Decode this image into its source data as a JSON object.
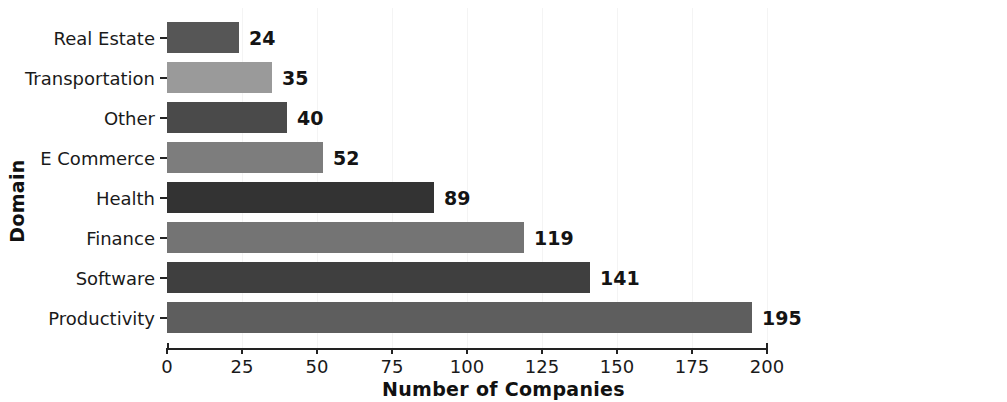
{
  "chart_data": {
    "type": "bar",
    "orientation": "horizontal",
    "title": "",
    "xlabel": "Number of Companies",
    "ylabel": "Domain",
    "categories": [
      "Real Estate",
      "Transportation",
      "Other",
      "E Commerce",
      "Health",
      "Finance",
      "Software",
      "Productivity"
    ],
    "values": [
      24,
      35,
      40,
      52,
      89,
      119,
      141,
      195
    ],
    "bar_colors": [
      "#565656",
      "#9a9a9a",
      "#4a4a4a",
      "#7d7d7d",
      "#333333",
      "#747474",
      "#3f3f3f",
      "#5e5e5e"
    ],
    "xlim": [
      0,
      200
    ],
    "xticks": [
      0,
      25,
      50,
      75,
      100,
      125,
      150,
      175,
      200
    ],
    "xtick_labels": [
      "0",
      "25",
      "50",
      "75",
      "100",
      "125",
      "150",
      "175",
      "200"
    ],
    "data_labels": [
      "24",
      "35",
      "40",
      "52",
      "89",
      "119",
      "141",
      "195"
    ],
    "grid": true,
    "grid_axis": "x",
    "grid_color": "#f4f4f4",
    "legend": false,
    "axis_color": "#222222",
    "background": "#ffffff"
  },
  "axes": {
    "y_title": "Domain",
    "x_title": "Number of Companies"
  }
}
